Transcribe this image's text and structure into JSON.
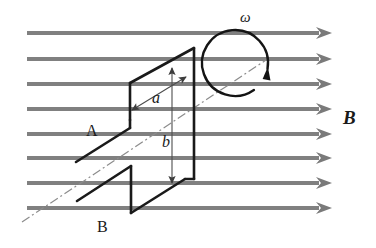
{
  "figure": {
    "background_color": "#ffffff",
    "width": 376,
    "height": 248
  },
  "colors": {
    "field_line": "#808080",
    "field_arrow": "#7a7a7a",
    "loop_stroke": "#1a1a1a",
    "axis_dashdot": "#8c8c8c",
    "dimension_arrow": "#4d4d4d",
    "rotation_arrow": "#141414",
    "text": "#1a1a1a"
  },
  "labels": {
    "field": {
      "text": "B",
      "style": "bold-italic",
      "x": 343,
      "y": 124,
      "font_size": 19
    },
    "angular_velocity": {
      "text": "ω",
      "style": "italic",
      "x": 240,
      "y": 22,
      "font_size": 15
    },
    "side_a": {
      "text": "a",
      "style": "italic",
      "x": 152,
      "y": 103,
      "font_size": 16
    },
    "side_b": {
      "text": "b",
      "style": "italic",
      "x": 162,
      "y": 147,
      "font_size": 16
    },
    "terminal_a": {
      "text": "A",
      "style": "upright",
      "x": 86,
      "y": 136,
      "font_size": 16
    },
    "terminal_b": {
      "text": "B",
      "style": "upright",
      "x": 97,
      "y": 232,
      "font_size": 16
    }
  },
  "field_lines": {
    "count": 8,
    "x_start": 27,
    "x_tip": 332,
    "stroke_width": 4,
    "arrow_half_height": 6,
    "arrow_length": 16,
    "y_values": [
      33,
      59,
      84,
      109,
      134,
      158,
      183,
      208
    ]
  },
  "loop": {
    "description": "Rectangular conducting loop drawn in perspective as two offset parallelogram faces joined by vertical edges",
    "stroke_width": 2.6,
    "upper_face_points": "130,120 130,83 194,48 194,85",
    "right_edge": {
      "x1": 194,
      "y1": 48,
      "x2": 194,
      "y2": 179
    },
    "left_edge": {
      "x1": 130,
      "y1": 83,
      "x2": 130,
      "y2": 120
    },
    "upper_top_slant": {
      "x1": 130,
      "y1": 83,
      "x2": 194,
      "y2": 48
    },
    "lead_a": {
      "x1": 130,
      "y1": 128,
      "x2": 76,
      "y2": 162
    },
    "upper_join": {
      "x1": 130,
      "y1": 120,
      "x2": 130,
      "y2": 128
    },
    "lower_left_edge": {
      "x1": 131,
      "y1": 166,
      "x2": 131,
      "y2": 213
    },
    "lower_top_slant": {
      "x1": 77,
      "y1": 201,
      "x2": 131,
      "y2": 166
    },
    "lower_bottom_slant": {
      "x1": 131,
      "y1": 213,
      "x2": 185,
      "y2": 179
    },
    "lower_right_join": {
      "x1": 185,
      "y1": 179,
      "x2": 194,
      "y2": 179
    },
    "lead_b": {
      "x1": 77,
      "y1": 201,
      "x2": 50,
      "y2": 201
    }
  },
  "rotation_axis": {
    "description": "dash-dot rotation axis running lower-left to upper-right through loop centre",
    "x1": 22,
    "y1": 222,
    "x2": 266,
    "y2": 60,
    "dash_pattern": "9,3,2,3",
    "stroke_width": 1.2
  },
  "rotation_arrow": {
    "description": "clockwise circular arrow around the rotation axis",
    "center_x": 235,
    "center_y": 63,
    "radius": 33,
    "stroke_width": 2.4,
    "gap_start_deg": 10,
    "gap_end_deg": 55,
    "arrowhead_at": "top-right"
  },
  "dimension_a": {
    "description": "double-headed arrow along the slanted side, labelled a",
    "x1": 132,
    "y1": 110,
    "x2": 186,
    "y2": 77,
    "double_headed": true,
    "stroke_width": 1.1
  },
  "dimension_b": {
    "description": "double-headed vertical arrow spanning the loop height, labelled b",
    "x1": 172,
    "y1": 68,
    "x2": 172,
    "y2": 183,
    "double_headed": true,
    "stroke_width": 1.1
  }
}
